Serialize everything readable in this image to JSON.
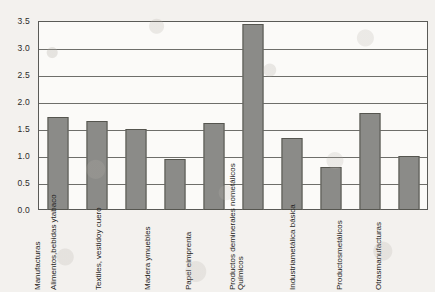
{
  "chart_data": {
    "type": "bar",
    "title": "",
    "subtitle": "",
    "xlabel": "",
    "ylabel": "",
    "ylim": [
      0.0,
      3.5
    ],
    "ytick_labels": [
      "3.5",
      "3.0",
      "2.5",
      "2.0",
      "1.5",
      "1.0",
      "0.5",
      "0.0"
    ],
    "ytick_values": [
      3.5,
      3.0,
      2.5,
      2.0,
      1.5,
      1.0,
      0.5,
      0.0
    ],
    "grid": "horizontal",
    "legend": "none",
    "bar_color": "#8d8d8a",
    "bar_edge_color": "#55554f",
    "axis_color": "#5a5a57",
    "background_color": "#f3f1ee",
    "plot_background_color": "#fbfaf8",
    "categories": [
      "Manufacturas",
      "Alimentos, bebidas y tabaco",
      "Textiles, vestido y cuero",
      "Madera y muebles",
      "Papel e imprenta",
      "Químicos",
      "Productos de minerales no metálicos",
      "Industria metálica básica",
      "Productos metálicos",
      "Otras manufacturas"
    ],
    "category_label_lines": [
      [
        "Manufacturas"
      ],
      [
        "Alimentos,",
        "bebidas y",
        "tabaco"
      ],
      [
        "Textiles, vestido",
        "y cuero"
      ],
      [
        "Madera y",
        "muebles"
      ],
      [
        "Papel e",
        "imprenta"
      ],
      [
        "Químicos"
      ],
      [
        "Productos de",
        "minerales no",
        "metálicos"
      ],
      [
        "Industria",
        "metálica básica"
      ],
      [
        "Productos",
        "metálicos"
      ],
      [
        "Otras",
        "manufacturas"
      ]
    ],
    "values": [
      1.73,
      1.64,
      1.5,
      0.95,
      1.61,
      3.45,
      1.33,
      0.8,
      1.8,
      1.0
    ]
  }
}
